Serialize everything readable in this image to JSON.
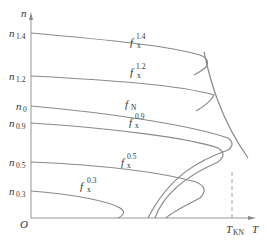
{
  "diagram": {
    "axes": {
      "y_label": "n",
      "x_label": "T",
      "origin_label": "O"
    },
    "y_ticks": [
      {
        "base": "n",
        "sub": "1.4"
      },
      {
        "base": "n",
        "sub": "1.2"
      },
      {
        "base": "n",
        "sub": "0"
      },
      {
        "base": "n",
        "sub": "0.9"
      },
      {
        "base": "n",
        "sub": "0.5"
      },
      {
        "base": "n",
        "sub": "0.3"
      }
    ],
    "x_ticks": [
      {
        "base": "T",
        "sub": "KN"
      }
    ],
    "curve_labels": [
      {
        "base": "f",
        "sub": "x",
        "sup": "1.4"
      },
      {
        "base": "f",
        "sub": "x",
        "sup": "1.2"
      },
      {
        "base": "f",
        "sub": "N",
        "sup": ""
      },
      {
        "base": "f",
        "sub": "x",
        "sup": "0.9"
      },
      {
        "base": "f",
        "sub": "x",
        "sup": "0.5"
      },
      {
        "base": "f",
        "sub": "x",
        "sup": "0.3"
      }
    ],
    "colors": {
      "curve": "#8a8a8a",
      "text": "#333333"
    }
  }
}
